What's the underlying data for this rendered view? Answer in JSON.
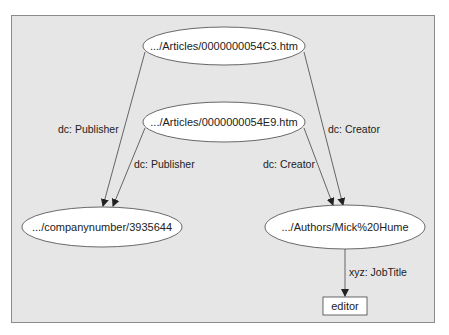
{
  "diagram": {
    "nodes": [
      {
        "id": "article1",
        "label": ".../Articles/0000000054C3.htm",
        "shape": "ellipse",
        "cx": 224,
        "cy": 46,
        "rx": 81,
        "ry": 19
      },
      {
        "id": "article2",
        "label": ".../Articles/0000000054E9.htm",
        "shape": "ellipse",
        "cx": 224,
        "cy": 122,
        "rx": 81,
        "ry": 20
      },
      {
        "id": "company",
        "label": ".../companynumber/3935644",
        "shape": "ellipse",
        "cx": 102,
        "cy": 227,
        "rx": 80,
        "ry": 20
      },
      {
        "id": "author",
        "label": ".../Authors/Mick%20Hume",
        "shape": "ellipse",
        "cx": 345,
        "cy": 227,
        "rx": 80,
        "ry": 22
      },
      {
        "id": "editor",
        "label": "editor",
        "shape": "rect",
        "x": 323,
        "y": 297,
        "w": 44,
        "h": 18
      }
    ],
    "edges": [
      {
        "from": "article1",
        "to": "company",
        "label": "dc: Publisher"
      },
      {
        "from": "article2",
        "to": "company",
        "label": "dc: Publisher"
      },
      {
        "from": "article1",
        "to": "author",
        "label": "dc: Creator"
      },
      {
        "from": "article2",
        "to": "author",
        "label": "dc: Creator"
      },
      {
        "from": "author",
        "to": "editor",
        "label": "xyz: JobTitle"
      }
    ],
    "colors": {
      "background": "#e6e6e6",
      "border": "#8a8a8a",
      "node_fill": "#ffffff",
      "stroke": "#444444"
    }
  }
}
